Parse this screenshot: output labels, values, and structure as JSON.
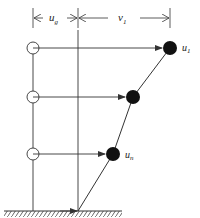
{
  "diagram": {
    "type": "structural-dynamics-displacement",
    "dimension_labels": {
      "ug": {
        "main": "u",
        "sub": "g"
      },
      "v1": {
        "main": "v",
        "sub": "1"
      }
    },
    "mass_labels": {
      "top": {
        "main": "u",
        "sub": "1"
      },
      "bottom": {
        "main": "u",
        "sub": "n"
      }
    },
    "floors": [
      {
        "name": "floor-1",
        "y": 48,
        "ref_x": 33,
        "mass_x": 170
      },
      {
        "name": "floor-2",
        "y": 97,
        "ref_x": 33,
        "mass_x": 133
      },
      {
        "name": "floor-3",
        "y": 154,
        "ref_x": 33,
        "mass_x": 113
      }
    ],
    "ground": {
      "y": 211,
      "x_start": 4,
      "x_end": 122
    },
    "base_x": 78,
    "colors": {
      "line": "#333333",
      "mass": "#111111",
      "background": "#ffffff"
    }
  }
}
